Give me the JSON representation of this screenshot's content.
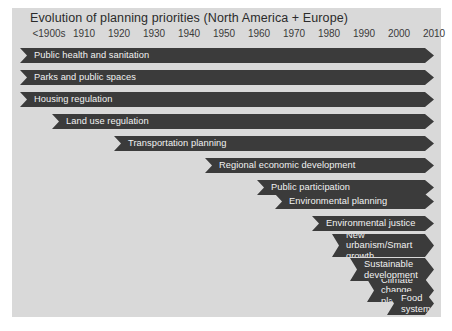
{
  "figure": {
    "title": "Evolution of planning priorities (North America + Europe)",
    "panel_color": "#d9d9d9",
    "bar_color": "#3b3b3b",
    "label_color": "#f2f2f2",
    "background_color": "#ffffff"
  },
  "axis": {
    "label": "",
    "ticks": [
      "<1900s",
      "1910",
      "1920",
      "1930",
      "1940",
      "1950",
      "1960",
      "1970",
      "1980",
      "1990",
      "2000",
      "2010"
    ]
  },
  "chart_data": {
    "type": "bar",
    "title": "Evolution of planning priorities (North America + Europe)",
    "xlabel": "",
    "ylabel": "",
    "orientation": "horizontal",
    "style": "timeline-chevron-gantt",
    "grid": false,
    "legend": "none",
    "x_tick_labels": [
      "<1900s",
      "1910",
      "1920",
      "1930",
      "1940",
      "1950",
      "1960",
      "1970",
      "1980",
      "1990",
      "2000",
      "2010"
    ],
    "xlim": [
      "<1900s",
      "2010+"
    ],
    "categories": [
      "Public health and sanitation",
      "Parks and public spaces",
      "Housing regulation",
      "Land use regulation",
      "Transportation planning",
      "Regional economic development",
      "Public participation",
      "Environmental planning",
      "Environmental justice",
      "New urbanism/Smart growth",
      "Sustainable development",
      "Climate change planning",
      "Food systems"
    ],
    "series": [
      {
        "name": "start decade",
        "values": [
          "<1900s",
          "<1900s",
          "<1900s",
          "1910s",
          "1930s",
          "1950s",
          "1960s",
          "1960s",
          "1980s",
          "1980s",
          "1990s",
          "2000s",
          "2010s"
        ]
      },
      {
        "name": "end decade",
        "values": [
          "present",
          "present",
          "present",
          "present",
          "present",
          "present",
          "present",
          "present",
          "present",
          "present",
          "present",
          "present",
          "present"
        ]
      }
    ],
    "bars": [
      {
        "label": "Public health and sanitation",
        "start_decade": "<1900s",
        "end_decade": "present",
        "lines": 1
      },
      {
        "label": "Parks and public spaces",
        "start_decade": "<1900s",
        "end_decade": "present",
        "lines": 1
      },
      {
        "label": "Housing regulation",
        "start_decade": "<1900s",
        "end_decade": "present",
        "lines": 1
      },
      {
        "label": "Land use regulation",
        "start_decade": "1910s",
        "end_decade": "present",
        "lines": 1
      },
      {
        "label": "Transportation planning",
        "start_decade": "1930s",
        "end_decade": "present",
        "lines": 1
      },
      {
        "label": "Regional economic development",
        "start_decade": "1950s",
        "end_decade": "present",
        "lines": 1
      },
      {
        "label": "Public participation",
        "start_decade": "1960s",
        "end_decade": "present",
        "lines": 1
      },
      {
        "label": "Environmental planning",
        "start_decade": "1960s",
        "end_decade": "present",
        "lines": 1
      },
      {
        "label": "Environmental justice",
        "start_decade": "1980s",
        "end_decade": "present",
        "lines": 1
      },
      {
        "label": "New urbanism/Smart growth",
        "start_decade": "1980s",
        "end_decade": "present",
        "lines": 2
      },
      {
        "label": "Sustainable development",
        "start_decade": "1990s",
        "end_decade": "present",
        "lines": 2
      },
      {
        "label": "Climate change planning",
        "start_decade": "2000s",
        "end_decade": "present",
        "lines": 2
      },
      {
        "label": "Food systems",
        "start_decade": "2010s",
        "end_decade": "present",
        "lines": 2
      }
    ]
  },
  "bars": [
    {
      "name": "bar-public-health-and-sanitation",
      "text": "Public health and sanitation",
      "left": 20,
      "top": 48,
      "height": 15
    },
    {
      "name": "bar-parks-and-public-spaces",
      "text": "Parks and public spaces",
      "left": 20,
      "top": 70,
      "height": 15
    },
    {
      "name": "bar-housing-regulation",
      "text": "Housing regulation",
      "left": 20,
      "top": 92,
      "height": 15
    },
    {
      "name": "bar-land-use-regulation",
      "text": "Land use regulation",
      "left": 52,
      "top": 114,
      "height": 15
    },
    {
      "name": "bar-transportation-planning",
      "text": "Transportation planning",
      "left": 114,
      "top": 136,
      "height": 15
    },
    {
      "name": "bar-regional-economic-development",
      "text": "Regional economic development",
      "left": 205,
      "top": 158,
      "height": 15
    },
    {
      "name": "bar-public-participation",
      "text": "Public participation",
      "left": 257,
      "top": 180,
      "height": 15
    },
    {
      "name": "bar-environmental-planning",
      "text": "Environmental planning",
      "left": 275,
      "top": 194,
      "height": 15
    },
    {
      "name": "bar-environmental-justice",
      "text": "Environmental justice",
      "left": 312,
      "top": 216,
      "height": 15
    },
    {
      "name": "bar-new-urbanism-smart-growth",
      "text": "New urbanism/Smart\ngrowth",
      "left": 332,
      "top": 234,
      "height": 23
    },
    {
      "name": "bar-sustainable-development",
      "text": "Sustainable\ndevelopment",
      "left": 350,
      "top": 258,
      "height": 23
    },
    {
      "name": "bar-climate-change-planning",
      "text": "Climate change\nplanning",
      "left": 367,
      "top": 279,
      "height": 23
    },
    {
      "name": "bar-food-systems",
      "text": "Food\nsystems",
      "left": 387,
      "top": 292,
      "height": 23
    }
  ],
  "tick_positions": [
    37,
    72,
    107,
    142,
    177,
    212,
    247,
    282,
    317,
    352,
    387,
    422
  ]
}
